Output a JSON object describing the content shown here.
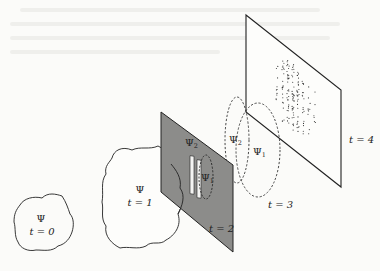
{
  "figure": {
    "colors": {
      "line": "#222222",
      "plane_fill_t2": "#8c8c8a",
      "background": "#fbfbf9",
      "dots": "#333333"
    },
    "stages": [
      {
        "id": "t0",
        "psi_label": "Ψ",
        "time_label": "t = 0"
      },
      {
        "id": "t1",
        "psi_label": "Ψ",
        "time_label": "t = 1"
      },
      {
        "id": "t2",
        "time_label": "t = 2",
        "psi2_label": "Ψ",
        "psi2_sub": "2",
        "psi1_label": "Ψ",
        "psi1_sub": "1"
      },
      {
        "id": "t3",
        "time_label": "t = 3",
        "psi2_label": "Ψ",
        "psi2_sub": "2",
        "psi1_label": "Ψ",
        "psi1_sub": "1"
      },
      {
        "id": "t4",
        "time_label": "t = 4"
      }
    ]
  }
}
